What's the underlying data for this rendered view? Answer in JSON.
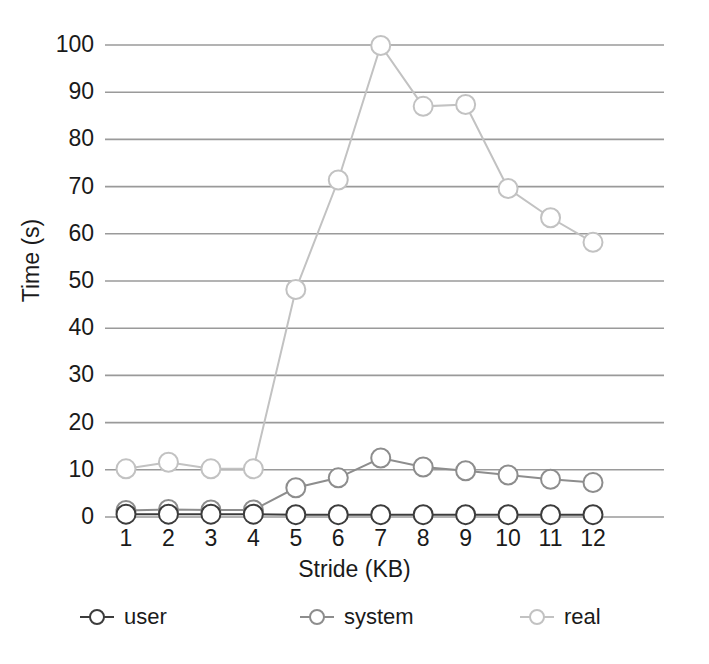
{
  "chart_data": {
    "type": "line",
    "title": "",
    "subtitle": "",
    "xlabel": "Stride (KB)",
    "ylabel": "Time (s)",
    "x": [
      1,
      2,
      3,
      4,
      5,
      6,
      7,
      8,
      9,
      10,
      11,
      12
    ],
    "categories": [
      "1",
      "2",
      "3",
      "4",
      "5",
      "6",
      "7",
      "8",
      "9",
      "10",
      "11",
      "12"
    ],
    "xlim": [
      1,
      12
    ],
    "ylim": [
      0,
      100
    ],
    "yticks": [
      0,
      10,
      20,
      30,
      40,
      50,
      60,
      70,
      80,
      90,
      100
    ],
    "ytick_labels": [
      "0",
      "10",
      "20",
      "30",
      "40",
      "50",
      "60",
      "70",
      "80",
      "90",
      "100"
    ],
    "grid": true,
    "grid_axis": "y",
    "legend_position": "bottom",
    "marker": "circle-open",
    "series": [
      {
        "name": "user",
        "color": "#3c3c3c",
        "values": [
          0.6,
          0.6,
          0.6,
          0.6,
          0.5,
          0.5,
          0.5,
          0.5,
          0.5,
          0.5,
          0.5,
          0.5
        ]
      },
      {
        "name": "system",
        "color": "#8d8d8d",
        "values": [
          1.4,
          1.6,
          1.5,
          1.5,
          6.2,
          8.3,
          12.5,
          10.6,
          9.8,
          8.9,
          8.0,
          7.3
        ]
      },
      {
        "name": "real",
        "color": "#c2c2c2",
        "values": [
          10.2,
          11.6,
          10.2,
          10.2,
          48.2,
          71.4,
          99.9,
          87.0,
          87.4,
          69.6,
          63.4,
          58.2
        ]
      }
    ]
  },
  "legend": {
    "items": [
      {
        "label": "user",
        "color": "#3c3c3c"
      },
      {
        "label": "system",
        "color": "#8d8d8d"
      },
      {
        "label": "real",
        "color": "#c2c2c2"
      }
    ]
  },
  "colors": {
    "background": "#ffffff",
    "grid": "#9a9a9a",
    "text": "#1a1a1a"
  }
}
